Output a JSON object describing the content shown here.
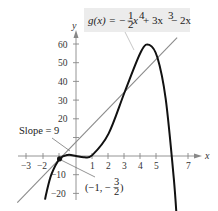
{
  "chart_data": {
    "type": "line",
    "xlabel": "x",
    "ylabel": "y",
    "xlim": [
      -3.6,
      7.5
    ],
    "ylim": [
      -25,
      65
    ],
    "grid": false,
    "x_ticks": [
      -3,
      -2,
      -1,
      1,
      2,
      3,
      4,
      5,
      7
    ],
    "x_tick_labels": [
      "−3",
      "−2",
      "",
      "1",
      "2",
      "3",
      "4",
      "5",
      "7"
    ],
    "y_ticks": [
      60,
      50,
      40,
      30,
      20,
      10,
      -10,
      -20
    ],
    "y_tick_labels": [
      "60",
      "50",
      "40",
      "30",
      "20",
      "",
      "−10",
      "−20"
    ],
    "series": [
      {
        "name": "g(x) = -1/2 x^4 + 3x^3 - 2x",
        "color": "#111111",
        "x": [
          -1.9,
          -1.8,
          -1.5,
          -1,
          -0.5,
          0,
          0.5,
          1,
          2,
          3,
          4,
          4.5,
          5,
          5.5,
          6,
          6.2
        ],
        "y": [
          -23.3,
          -19.1,
          -9.66,
          -1.5,
          0.59,
          0,
          -0.66,
          0.5,
          12,
          34.5,
          56,
          59.4,
          52.5,
          30.6,
          -12,
          -36.3
        ]
      },
      {
        "name": "Tangent line at (-1, -3/2), slope 9: y = 9x + 7.5",
        "color": "#888888",
        "x": [
          -3.6,
          6.2
        ],
        "y": [
          -24.9,
          63.3
        ]
      }
    ],
    "annotations": [
      {
        "text": "g(x) = −½x⁴ + 3x³ − 2x",
        "target": "curve"
      },
      {
        "text": "Slope = 9",
        "target": "tangent line"
      },
      {
        "text": "(−1, −3/2)",
        "target": "point of tangency",
        "x": -1,
        "y": -1.5
      }
    ]
  },
  "labels": {
    "eq_prefix": "g(x) = −",
    "eq_frac_num": "1",
    "eq_frac_den": "2",
    "eq_x": "x",
    "eq_exp4": "4",
    "eq_mid": " + 3x",
    "eq_exp3": "3",
    "eq_tail": " − 2x",
    "slope": "Slope = 9",
    "point_open": "(−1, −",
    "point_num": "3",
    "point_den": "2",
    "point_close": ")",
    "x_axis": "x",
    "y_axis": "y",
    "xt": [
      "−3",
      "−2",
      "1",
      "2",
      "3",
      "4",
      "5",
      "7"
    ],
    "yt": [
      "60",
      "50",
      "40",
      "30",
      "20",
      "−10",
      "−20"
    ]
  }
}
